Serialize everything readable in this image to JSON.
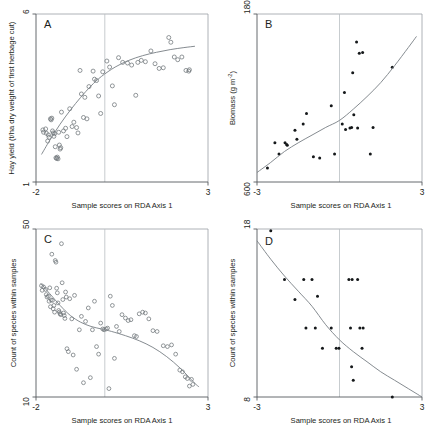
{
  "figure": {
    "background": "#ffffff",
    "axis_color": "#555a5e",
    "curve_color": "#7e858a",
    "point_open_color": "#6d7478",
    "point_filled_color": "#15181a",
    "vertical_reference_color": "#b9bfc3",
    "shared_xlabel": "Sample scores on RDA Axis 1"
  },
  "chart_data": [
    {
      "type": "scatter",
      "panel": "A",
      "panel_label": "A",
      "title": "",
      "xlabel": "Sample scores on RDA Axis 1",
      "ylabel": "Hay yield (t/ha dry weight of first herbage cut)",
      "xlim": [
        -2,
        3
      ],
      "ylim": [
        1,
        6
      ],
      "xticks": [
        -2,
        3
      ],
      "xtick_labels": [
        "-2",
        "3"
      ],
      "yticks": [
        1,
        6
      ],
      "ytick_labels": [
        "1",
        "6"
      ],
      "grid": false,
      "legend": false,
      "marker": "open-circle",
      "vertical_reference_x": 0,
      "points": [
        [
          -1.8,
          2.55
        ],
        [
          -1.78,
          2.48
        ],
        [
          -1.72,
          2.58
        ],
        [
          -1.7,
          2.45
        ],
        [
          -1.66,
          2.22
        ],
        [
          -1.64,
          2.4
        ],
        [
          -1.62,
          2.33
        ],
        [
          -1.58,
          2.88
        ],
        [
          -1.56,
          2.85
        ],
        [
          -1.54,
          2.9
        ],
        [
          -1.52,
          2.52
        ],
        [
          -1.5,
          2.46
        ],
        [
          -1.48,
          2.36
        ],
        [
          -1.46,
          2.44
        ],
        [
          -1.44,
          2.05
        ],
        [
          -1.42,
          1.72
        ],
        [
          -1.4,
          1.7
        ],
        [
          -1.38,
          1.74
        ],
        [
          -1.36,
          1.69
        ],
        [
          -1.34,
          2.48
        ],
        [
          -1.32,
          2.1
        ],
        [
          -1.3,
          1.98
        ],
        [
          -1.28,
          2.02
        ],
        [
          -1.26,
          3.08
        ],
        [
          -1.2,
          2.52
        ],
        [
          -1.14,
          2.6
        ],
        [
          -1.1,
          2.35
        ],
        [
          -1.02,
          3.18
        ],
        [
          -0.95,
          2.65
        ],
        [
          -0.9,
          2.78
        ],
        [
          -0.82,
          2.62
        ],
        [
          -0.78,
          2.46
        ],
        [
          -0.72,
          4.32
        ],
        [
          -0.68,
          3.62
        ],
        [
          -0.62,
          2.92
        ],
        [
          -0.58,
          3.52
        ],
        [
          -0.52,
          2.88
        ],
        [
          -0.46,
          3.84
        ],
        [
          -0.34,
          4.3
        ],
        [
          -0.3,
          4.06
        ],
        [
          -0.24,
          4.02
        ],
        [
          -0.18,
          3.56
        ],
        [
          -0.12,
          3.04
        ],
        [
          -0.06,
          4.28
        ],
        [
          0.06,
          4.6
        ],
        [
          0.14,
          4.42
        ],
        [
          0.22,
          3.86
        ],
        [
          0.28,
          3.3
        ],
        [
          0.4,
          4.7
        ],
        [
          0.52,
          4.56
        ],
        [
          0.66,
          4.54
        ],
        [
          0.78,
          4.48
        ],
        [
          0.9,
          3.58
        ],
        [
          0.96,
          4.56
        ],
        [
          1.06,
          4.62
        ],
        [
          1.18,
          4.58
        ],
        [
          1.34,
          4.9
        ],
        [
          1.46,
          4.52
        ],
        [
          1.58,
          4.38
        ],
        [
          1.7,
          4.4
        ],
        [
          1.86,
          5.3
        ],
        [
          1.92,
          5.16
        ],
        [
          2.02,
          4.72
        ],
        [
          2.12,
          4.64
        ],
        [
          2.24,
          4.72
        ],
        [
          2.36,
          4.32
        ],
        [
          2.44,
          4.3
        ],
        [
          2.46,
          4.34
        ]
      ],
      "fit_curve": [
        [
          -1.84,
          1.82
        ],
        [
          -1.6,
          2.24
        ],
        [
          -1.3,
          2.72
        ],
        [
          -1.0,
          3.14
        ],
        [
          -0.7,
          3.52
        ],
        [
          -0.4,
          3.86
        ],
        [
          -0.1,
          4.14
        ],
        [
          0.3,
          4.42
        ],
        [
          0.7,
          4.62
        ],
        [
          1.1,
          4.76
        ],
        [
          1.5,
          4.86
        ],
        [
          1.9,
          4.94
        ],
        [
          2.3,
          5.0
        ],
        [
          2.62,
          5.04
        ]
      ]
    },
    {
      "type": "scatter",
      "panel": "B",
      "panel_label": "B",
      "title": "",
      "xlabel": "Sample scores on RDA Axis 1",
      "ylabel": "Biomass (g m-2)",
      "ylabel_base": "Biomass (g m",
      "ylabel_sup": "-2",
      "ylabel_tail": ")",
      "xlim": [
        -3,
        3
      ],
      "ylim": [
        600,
        1800
      ],
      "xticks": [
        -3,
        3
      ],
      "xtick_labels": [
        "-3",
        "3"
      ],
      "yticks": [
        600,
        1800
      ],
      "ytick_labels": [
        "600",
        "1800"
      ],
      "grid": false,
      "legend": false,
      "marker": "filled-circle",
      "vertical_reference_x": 0,
      "points": [
        [
          -2.62,
          700
        ],
        [
          -2.35,
          880
        ],
        [
          -2.2,
          800
        ],
        [
          -1.98,
          880
        ],
        [
          -1.92,
          868
        ],
        [
          -1.9,
          862
        ],
        [
          -1.62,
          970
        ],
        [
          -1.55,
          905
        ],
        [
          -1.2,
          1090
        ],
        [
          -1.32,
          1015
        ],
        [
          -0.95,
          780
        ],
        [
          -0.72,
          772
        ],
        [
          -0.3,
          1145
        ],
        [
          -0.18,
          800
        ],
        [
          0.1,
          1015
        ],
        [
          0.18,
          1240
        ],
        [
          0.22,
          975
        ],
        [
          0.38,
          985
        ],
        [
          0.44,
          990
        ],
        [
          0.48,
          1380
        ],
        [
          0.52,
          1080
        ],
        [
          0.62,
          1600
        ],
        [
          0.66,
          985
        ],
        [
          0.72,
          1520
        ],
        [
          0.84,
          1525
        ],
        [
          1.12,
          800
        ],
        [
          1.22,
          990
        ],
        [
          1.92,
          1420
        ]
      ],
      "fit_curve": [
        [
          -3.0,
          668
        ],
        [
          -2.5,
          740
        ],
        [
          -2.0,
          818
        ],
        [
          -1.5,
          880
        ],
        [
          -1.0,
          935
        ],
        [
          -0.5,
          990
        ],
        [
          0.0,
          1040
        ],
        [
          0.5,
          1120
        ],
        [
          1.0,
          1210
        ],
        [
          1.5,
          1310
        ],
        [
          2.0,
          1430
        ],
        [
          2.5,
          1560
        ],
        [
          2.8,
          1640
        ]
      ]
    },
    {
      "type": "scatter",
      "panel": "C",
      "panel_label": "C",
      "title": "",
      "xlabel": "Sample scores on RDA Axis 1",
      "ylabel": "Count of species within samples",
      "xlim": [
        -2,
        3
      ],
      "ylim": [
        10,
        50
      ],
      "xticks": [
        -2,
        3
      ],
      "xtick_labels": [
        "-2",
        "3"
      ],
      "yticks": [
        10,
        50
      ],
      "ytick_labels": [
        "10",
        "50"
      ],
      "grid": false,
      "legend": false,
      "marker": "open-circle",
      "vertical_reference_x": 0,
      "points": [
        [
          -1.84,
          36.5
        ],
        [
          -1.82,
          35.4
        ],
        [
          -1.78,
          36.2
        ],
        [
          -1.72,
          35.6
        ],
        [
          -1.7,
          34.4
        ],
        [
          -1.68,
          33.8
        ],
        [
          -1.64,
          34.0
        ],
        [
          -1.62,
          32.8
        ],
        [
          -1.6,
          36.0
        ],
        [
          -1.58,
          31.5
        ],
        [
          -1.56,
          33.1
        ],
        [
          -1.54,
          44.0
        ],
        [
          -1.52,
          33.0
        ],
        [
          -1.5,
          31.0
        ],
        [
          -1.48,
          31.8
        ],
        [
          -1.46,
          30.2
        ],
        [
          -1.44,
          42.5
        ],
        [
          -1.42,
          42.1
        ],
        [
          -1.4,
          35.9
        ],
        [
          -1.38,
          34.8
        ],
        [
          -1.36,
          32.4
        ],
        [
          -1.34,
          30.6
        ],
        [
          -1.32,
          30.2
        ],
        [
          -1.3,
          29.8
        ],
        [
          -1.28,
          29.6
        ],
        [
          -1.26,
          46.5
        ],
        [
          -1.24,
          37.2
        ],
        [
          -1.22,
          33.2
        ],
        [
          -1.2,
          30.0
        ],
        [
          -1.18,
          29.4
        ],
        [
          -1.16,
          28.7
        ],
        [
          -1.14,
          35.0
        ],
        [
          -1.12,
          33.8
        ],
        [
          -1.1,
          21.5
        ],
        [
          -1.06,
          20.8
        ],
        [
          -1.02,
          33.4
        ],
        [
          -0.96,
          28.6
        ],
        [
          -0.92,
          20.0
        ],
        [
          -0.88,
          34.2
        ],
        [
          -0.82,
          16.6
        ],
        [
          -0.74,
          26.0
        ],
        [
          -0.68,
          29.2
        ],
        [
          -0.62,
          13.4
        ],
        [
          -0.56,
          28.0
        ],
        [
          -0.48,
          31.2
        ],
        [
          -0.42,
          14.6
        ],
        [
          -0.36,
          26.0
        ],
        [
          -0.3,
          32.8
        ],
        [
          -0.24,
          22.0
        ],
        [
          -0.18,
          20.2
        ],
        [
          -0.12,
          27.6
        ],
        [
          -0.06,
          26.2
        ],
        [
          -0.02,
          26.0
        ],
        [
          0.04,
          26.2
        ],
        [
          0.08,
          26.4
        ],
        [
          0.12,
          12.0
        ],
        [
          0.16,
          34.0
        ],
        [
          0.22,
          31.8
        ],
        [
          0.28,
          19.2
        ],
        [
          0.34,
          26.8
        ],
        [
          0.42,
          25.6
        ],
        [
          0.5,
          29.6
        ],
        [
          0.6,
          28.8
        ],
        [
          0.68,
          28.2
        ],
        [
          0.76,
          28.4
        ],
        [
          0.86,
          24.6
        ],
        [
          0.92,
          24.4
        ],
        [
          1.0,
          29.8
        ],
        [
          1.1,
          30.2
        ],
        [
          1.18,
          30.0
        ],
        [
          1.28,
          28.6
        ],
        [
          1.4,
          25.8
        ],
        [
          1.52,
          25.6
        ],
        [
          1.7,
          22.2
        ],
        [
          1.82,
          22.0
        ],
        [
          1.94,
          22.4
        ],
        [
          2.06,
          20.2
        ],
        [
          2.18,
          16.4
        ],
        [
          2.26,
          16.0
        ],
        [
          2.34,
          14.8
        ],
        [
          2.4,
          14.4
        ],
        [
          2.46,
          12.6
        ],
        [
          2.52,
          14.2
        ],
        [
          2.56,
          13.0
        ]
      ],
      "fit_curve": [
        [
          -1.86,
          37.0
        ],
        [
          -1.6,
          34.6
        ],
        [
          -1.3,
          31.8
        ],
        [
          -1.0,
          29.4
        ],
        [
          -0.7,
          27.8
        ],
        [
          -0.4,
          26.8
        ],
        [
          -0.1,
          26.2
        ],
        [
          0.2,
          25.6
        ],
        [
          0.6,
          24.6
        ],
        [
          1.0,
          23.4
        ],
        [
          1.4,
          21.8
        ],
        [
          1.8,
          19.6
        ],
        [
          2.2,
          16.8
        ],
        [
          2.6,
          13.4
        ],
        [
          2.74,
          12.4
        ]
      ]
    },
    {
      "type": "scatter",
      "panel": "D",
      "panel_label": "D",
      "title": "",
      "xlabel": "Sample scores on RDA Axis 1",
      "ylabel": "Count of species within samples",
      "xlim": [
        -3,
        3
      ],
      "ylim": [
        8,
        18
      ],
      "xticks": [
        -3,
        3
      ],
      "xtick_labels": [
        "-3",
        "3"
      ],
      "yticks": [
        8,
        18
      ],
      "ytick_labels": [
        "8",
        "18"
      ],
      "grid": false,
      "legend": false,
      "marker": "filled-circle",
      "vertical_reference_x": 0,
      "points": [
        [
          -2.5,
          17.9
        ],
        [
          -2.0,
          15.0
        ],
        [
          -1.62,
          13.8
        ],
        [
          -1.3,
          15.0
        ],
        [
          -1.22,
          12.1
        ],
        [
          -1.0,
          15.0
        ],
        [
          -0.88,
          12.1
        ],
        [
          -0.8,
          14.0
        ],
        [
          -0.62,
          10.9
        ],
        [
          -0.3,
          12.1
        ],
        [
          -0.12,
          10.9
        ],
        [
          -0.02,
          10.9
        ],
        [
          0.34,
          15.0
        ],
        [
          0.46,
          15.0
        ],
        [
          0.4,
          12.1
        ],
        [
          0.44,
          9.8
        ],
        [
          0.5,
          9.0
        ],
        [
          0.66,
          15.0
        ],
        [
          0.74,
          12.1
        ],
        [
          0.86,
          12.1
        ],
        [
          0.82,
          10.9
        ],
        [
          1.92,
          8.0
        ]
      ],
      "fit_curve": [
        [
          -3.0,
          17.3
        ],
        [
          -2.5,
          16.2
        ],
        [
          -2.0,
          15.2
        ],
        [
          -1.5,
          14.3
        ],
        [
          -1.0,
          13.4
        ],
        [
          -0.5,
          12.3
        ],
        [
          0.0,
          11.4
        ],
        [
          0.5,
          10.7
        ],
        [
          1.0,
          10.1
        ],
        [
          1.5,
          9.5
        ],
        [
          2.0,
          9.0
        ],
        [
          2.5,
          8.5
        ],
        [
          3.0,
          8.0
        ]
      ]
    }
  ]
}
